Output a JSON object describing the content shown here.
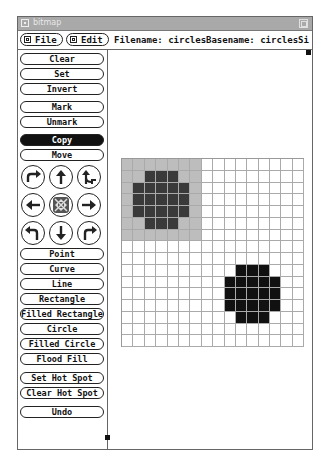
{
  "window": {
    "title": "bitmap"
  },
  "menubar": {
    "file_label": "File",
    "edit_label": "Edit",
    "filename_text": "Filename: circles",
    "basename_text": "Basename: circles",
    "size_text": "Si"
  },
  "sidebar": {
    "buttons_top": [
      {
        "label": "Clear"
      },
      {
        "label": "Set"
      },
      {
        "label": "Invert"
      },
      {
        "label": "Mark"
      },
      {
        "label": "Unmark"
      },
      {
        "label": "Copy",
        "active": true
      },
      {
        "label": "Move"
      }
    ],
    "arrows": [
      {
        "icon": "flip-horizontal-icon"
      },
      {
        "icon": "up-arrow-icon"
      },
      {
        "icon": "flip-vertical-icon"
      },
      {
        "icon": "left-arrow-icon"
      },
      {
        "icon": "fold-icon"
      },
      {
        "icon": "right-arrow-icon"
      },
      {
        "icon": "rotate-left-icon"
      },
      {
        "icon": "down-arrow-icon"
      },
      {
        "icon": "rotate-right-icon"
      }
    ],
    "buttons_tools": [
      {
        "label": "Point"
      },
      {
        "label": "Curve"
      },
      {
        "label": "Line"
      },
      {
        "label": "Rectangle"
      },
      {
        "label": "Filled Rectangle"
      },
      {
        "label": "Circle"
      },
      {
        "label": "Filled Circle"
      },
      {
        "label": "Flood Fill"
      }
    ],
    "buttons_bottom": [
      {
        "label": "Set Hot Spot"
      },
      {
        "label": "Clear Hot Spot"
      },
      {
        "label": "Undo"
      }
    ]
  },
  "bitmap": {
    "columns": 16,
    "rows": 16,
    "selection": {
      "col_start": 0,
      "col_end": 6,
      "row_start": 0,
      "row_end": 6
    },
    "set_pixels": [
      [
        1,
        2
      ],
      [
        1,
        3
      ],
      [
        1,
        4
      ],
      [
        2,
        1
      ],
      [
        2,
        2
      ],
      [
        2,
        3
      ],
      [
        2,
        4
      ],
      [
        2,
        5
      ],
      [
        3,
        1
      ],
      [
        3,
        2
      ],
      [
        3,
        3
      ],
      [
        3,
        4
      ],
      [
        3,
        5
      ],
      [
        4,
        1
      ],
      [
        4,
        2
      ],
      [
        4,
        3
      ],
      [
        4,
        4
      ],
      [
        4,
        5
      ],
      [
        5,
        2
      ],
      [
        5,
        3
      ],
      [
        5,
        4
      ],
      [
        9,
        10
      ],
      [
        9,
        11
      ],
      [
        9,
        12
      ],
      [
        10,
        9
      ],
      [
        10,
        10
      ],
      [
        10,
        11
      ],
      [
        10,
        12
      ],
      [
        10,
        13
      ],
      [
        11,
        9
      ],
      [
        11,
        10
      ],
      [
        11,
        11
      ],
      [
        11,
        12
      ],
      [
        11,
        13
      ],
      [
        12,
        9
      ],
      [
        12,
        10
      ],
      [
        12,
        11
      ],
      [
        12,
        12
      ],
      [
        12,
        13
      ],
      [
        13,
        10
      ],
      [
        13,
        11
      ],
      [
        13,
        12
      ]
    ]
  },
  "colors": {
    "titlebar": "#a9a9a9",
    "selection": "#bdbdbd",
    "pixel_on": "#111111",
    "active_button": "#111111"
  }
}
